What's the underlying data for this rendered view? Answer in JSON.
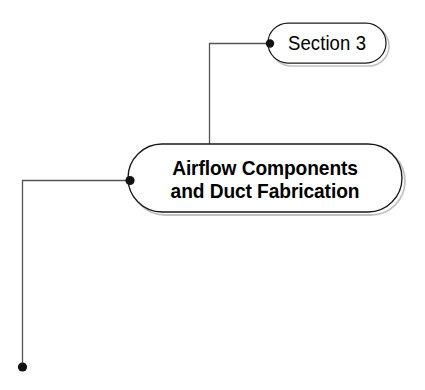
{
  "diagram": {
    "type": "mindmap-branch",
    "background_color": "#ffffff",
    "line_color": "#555555",
    "node_border_color": "#1a1a1a",
    "node_fill_color": "#ffffff",
    "dot_color": "#111111",
    "text_color": "#000000",
    "shadow_color": "#b8b8b8",
    "nodes": [
      {
        "id": "section-node",
        "label": "Section 3",
        "shape": "stadium",
        "emphasis": "normal",
        "x": 268,
        "y": 23,
        "width": 118,
        "height": 40
      },
      {
        "id": "main-node",
        "label_line_1": "Airflow Components",
        "label_line_2": "and Duct Fabrication",
        "label": "Airflow Components and Duct Fabrication",
        "shape": "stadium",
        "emphasis": "bold",
        "x": 128,
        "y": 144,
        "width": 274,
        "height": 68
      }
    ],
    "connectors": [
      {
        "id": "connector-section-to-main",
        "from": "main-node",
        "to": "section-node",
        "style": "orthogonal-elbow",
        "endpoint_dot": {
          "x": 270,
          "y": 44
        }
      },
      {
        "id": "connector-main-to-left-branch",
        "from": "main-node",
        "to": "left-branch-terminal",
        "style": "orthogonal-elbow",
        "endpoint_dot": {
          "x": 130,
          "y": 180
        },
        "terminal_dot": {
          "x": 22,
          "y": 367
        }
      }
    ]
  }
}
